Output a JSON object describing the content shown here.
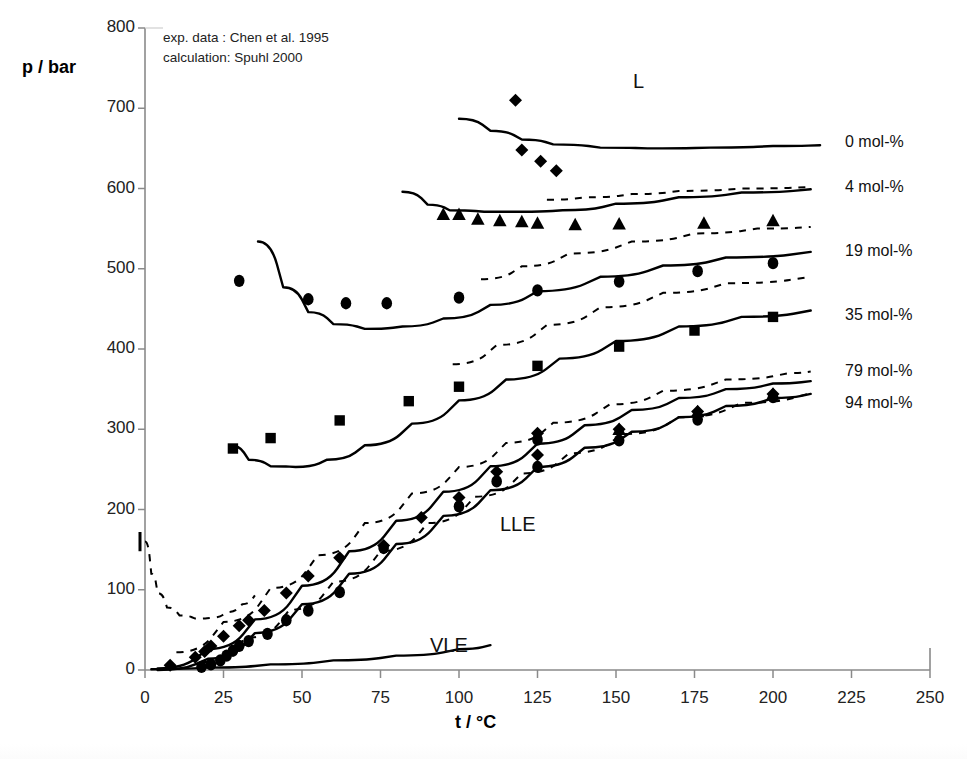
{
  "figure": {
    "annotations": [
      "exp. data  : Chen et al. 1995",
      "calculation: Spuhl 2000"
    ],
    "annotation_lines": {
      "line1": "exp. data  : Chen et al. 1995",
      "line2": "calculation: Spuhl 2000"
    }
  },
  "chart_data": {
    "type": "scatter",
    "title": "",
    "subtitle": "",
    "xlabel": "t / °C",
    "ylabel": "p / bar",
    "xlim": [
      0,
      250
    ],
    "ylim": [
      0,
      800
    ],
    "xticks": [
      0,
      25,
      50,
      75,
      100,
      125,
      150,
      175,
      200,
      225,
      250
    ],
    "yticks": [
      0,
      100,
      200,
      300,
      400,
      500,
      600,
      700,
      800
    ],
    "xtick_labels": [
      "0",
      "25",
      "50",
      "75",
      "100",
      "125",
      "150",
      "175",
      "200",
      "225",
      "250"
    ],
    "ytick_labels": [
      "0",
      "100",
      "200",
      "300",
      "400",
      "500",
      "600",
      "700",
      "800"
    ],
    "grid": false,
    "legend_position": "right-inline",
    "annotations": [
      {
        "text": "L",
        "x": 128,
        "y": 730
      },
      {
        "text": "LLE",
        "x": 130,
        "y": 195
      },
      {
        "text": "VLE",
        "x": 123,
        "y": 22
      },
      {
        "text": "exp. data  : Chen et al. 1995",
        "x": 12,
        "y": 768
      },
      {
        "text": "calculation: Spuhl 2000",
        "x": 12,
        "y": 742
      }
    ],
    "series": [
      {
        "name": "0 mol-%",
        "label": "0 mol-%",
        "label_y": 655,
        "marker": "diamond",
        "points": [
          {
            "x": 118,
            "y": 710
          },
          {
            "x": 120,
            "y": 648
          },
          {
            "x": 126,
            "y": 634
          },
          {
            "x": 131,
            "y": 622
          }
        ],
        "solid_curve": [
          {
            "x": 100,
            "y": 687
          },
          {
            "x": 110,
            "y": 672
          },
          {
            "x": 120,
            "y": 661
          },
          {
            "x": 130,
            "y": 655
          },
          {
            "x": 145,
            "y": 651
          },
          {
            "x": 160,
            "y": 650
          },
          {
            "x": 180,
            "y": 651
          },
          {
            "x": 200,
            "y": 653
          },
          {
            "x": 215,
            "y": 654
          }
        ],
        "dashed_curve": []
      },
      {
        "name": "4 mol-%",
        "label": "4 mol-%",
        "label_y": 600,
        "marker": "triangle",
        "points": [
          {
            "x": 95,
            "y": 568
          },
          {
            "x": 100,
            "y": 568
          },
          {
            "x": 106,
            "y": 562
          },
          {
            "x": 113,
            "y": 560
          },
          {
            "x": 120,
            "y": 559
          },
          {
            "x": 125,
            "y": 557
          },
          {
            "x": 137,
            "y": 555
          },
          {
            "x": 151,
            "y": 556
          },
          {
            "x": 178,
            "y": 557
          },
          {
            "x": 200,
            "y": 560
          }
        ],
        "solid_curve": [
          {
            "x": 82,
            "y": 596
          },
          {
            "x": 90,
            "y": 580
          },
          {
            "x": 97,
            "y": 573
          },
          {
            "x": 108,
            "y": 571
          },
          {
            "x": 120,
            "y": 571
          },
          {
            "x": 133,
            "y": 573
          },
          {
            "x": 150,
            "y": 581
          },
          {
            "x": 170,
            "y": 589
          },
          {
            "x": 190,
            "y": 595
          },
          {
            "x": 212,
            "y": 599
          }
        ],
        "dashed_curve": [
          {
            "x": 128,
            "y": 586
          },
          {
            "x": 140,
            "y": 589
          },
          {
            "x": 155,
            "y": 593
          },
          {
            "x": 170,
            "y": 597
          },
          {
            "x": 190,
            "y": 600
          },
          {
            "x": 212,
            "y": 602
          }
        ]
      },
      {
        "name": "19 mol-%",
        "label": "19 mol-%",
        "label_y": 520,
        "marker": "circle",
        "points": [
          {
            "x": 30,
            "y": 485
          },
          {
            "x": 52,
            "y": 462
          },
          {
            "x": 64,
            "y": 457
          },
          {
            "x": 77,
            "y": 457
          },
          {
            "x": 100,
            "y": 464
          },
          {
            "x": 125,
            "y": 473
          },
          {
            "x": 151,
            "y": 484
          },
          {
            "x": 176,
            "y": 497
          },
          {
            "x": 200,
            "y": 507
          }
        ],
        "solid_curve": [
          {
            "x": 36,
            "y": 534
          },
          {
            "x": 44,
            "y": 477
          },
          {
            "x": 52,
            "y": 446
          },
          {
            "x": 60,
            "y": 431
          },
          {
            "x": 70,
            "y": 425
          },
          {
            "x": 82,
            "y": 428
          },
          {
            "x": 95,
            "y": 438
          },
          {
            "x": 110,
            "y": 455
          },
          {
            "x": 125,
            "y": 472
          },
          {
            "x": 145,
            "y": 490
          },
          {
            "x": 165,
            "y": 504
          },
          {
            "x": 185,
            "y": 514
          },
          {
            "x": 212,
            "y": 521
          }
        ],
        "dashed_curve": [
          {
            "x": 107,
            "y": 487
          },
          {
            "x": 120,
            "y": 503
          },
          {
            "x": 135,
            "y": 519
          },
          {
            "x": 155,
            "y": 534
          },
          {
            "x": 175,
            "y": 544
          },
          {
            "x": 195,
            "y": 550
          },
          {
            "x": 212,
            "y": 552
          }
        ]
      },
      {
        "name": "35 mol-%",
        "label": "35 mol-%",
        "label_y": 440,
        "marker": "square",
        "points": [
          {
            "x": 28,
            "y": 276
          },
          {
            "x": 40,
            "y": 289
          },
          {
            "x": 62,
            "y": 311
          },
          {
            "x": 84,
            "y": 335
          },
          {
            "x": 100,
            "y": 353
          },
          {
            "x": 125,
            "y": 379
          },
          {
            "x": 151,
            "y": 403
          },
          {
            "x": 175,
            "y": 423
          },
          {
            "x": 200,
            "y": 440
          }
        ],
        "solid_curve": [
          {
            "x": 27,
            "y": 280
          },
          {
            "x": 33,
            "y": 262
          },
          {
            "x": 40,
            "y": 254
          },
          {
            "x": 48,
            "y": 253
          },
          {
            "x": 58,
            "y": 262
          },
          {
            "x": 70,
            "y": 280
          },
          {
            "x": 85,
            "y": 307
          },
          {
            "x": 100,
            "y": 336
          },
          {
            "x": 115,
            "y": 362
          },
          {
            "x": 132,
            "y": 388
          },
          {
            "x": 150,
            "y": 410
          },
          {
            "x": 170,
            "y": 428
          },
          {
            "x": 190,
            "y": 440
          },
          {
            "x": 212,
            "y": 448
          }
        ],
        "dashed_curve": [
          {
            "x": 98,
            "y": 381
          },
          {
            "x": 112,
            "y": 405
          },
          {
            "x": 128,
            "y": 430
          },
          {
            "x": 145,
            "y": 452
          },
          {
            "x": 165,
            "y": 470
          },
          {
            "x": 185,
            "y": 482
          },
          {
            "x": 212,
            "y": 490
          }
        ]
      },
      {
        "name": "79 mol-%",
        "label": "79 mol-%",
        "label_y": 370,
        "marker": "diamond",
        "points": [
          {
            "x": 8,
            "y": 6
          },
          {
            "x": 16,
            "y": 16
          },
          {
            "x": 19,
            "y": 23
          },
          {
            "x": 21,
            "y": 30
          },
          {
            "x": 25,
            "y": 42
          },
          {
            "x": 30,
            "y": 55
          },
          {
            "x": 33,
            "y": 62
          },
          {
            "x": 38,
            "y": 74
          },
          {
            "x": 45,
            "y": 96
          },
          {
            "x": 52,
            "y": 117
          },
          {
            "x": 62,
            "y": 140
          },
          {
            "x": 76,
            "y": 155
          },
          {
            "x": 88,
            "y": 190
          },
          {
            "x": 100,
            "y": 215
          },
          {
            "x": 112,
            "y": 247
          },
          {
            "x": 125,
            "y": 268
          },
          {
            "x": 125,
            "y": 295
          },
          {
            "x": 151,
            "y": 300
          },
          {
            "x": 176,
            "y": 322
          },
          {
            "x": 200,
            "y": 344
          }
        ],
        "solid_curve": [
          {
            "x": 4,
            "y": 2
          },
          {
            "x": 20,
            "y": 26
          },
          {
            "x": 35,
            "y": 63
          },
          {
            "x": 50,
            "y": 105
          },
          {
            "x": 65,
            "y": 148
          },
          {
            "x": 80,
            "y": 186
          },
          {
            "x": 95,
            "y": 222
          },
          {
            "x": 110,
            "y": 254
          },
          {
            "x": 125,
            "y": 282
          },
          {
            "x": 140,
            "y": 305
          },
          {
            "x": 155,
            "y": 324
          },
          {
            "x": 170,
            "y": 339
          },
          {
            "x": 185,
            "y": 350
          },
          {
            "x": 200,
            "y": 357
          },
          {
            "x": 212,
            "y": 360
          }
        ],
        "dashed_curve": [
          {
            "x": 10,
            "y": 22
          },
          {
            "x": 25,
            "y": 60
          },
          {
            "x": 40,
            "y": 102
          },
          {
            "x": 55,
            "y": 143
          },
          {
            "x": 70,
            "y": 183
          },
          {
            "x": 85,
            "y": 220
          },
          {
            "x": 100,
            "y": 253
          },
          {
            "x": 115,
            "y": 283
          },
          {
            "x": 130,
            "y": 308
          },
          {
            "x": 148,
            "y": 331
          },
          {
            "x": 165,
            "y": 348
          },
          {
            "x": 185,
            "y": 362
          },
          {
            "x": 205,
            "y": 370
          },
          {
            "x": 212,
            "y": 372
          }
        ]
      },
      {
        "name": "94 mol-%",
        "label": "94 mol-%",
        "label_y": 330,
        "marker": "circle",
        "points": [
          {
            "x": 18,
            "y": 4
          },
          {
            "x": 21,
            "y": 7
          },
          {
            "x": 24,
            "y": 12
          },
          {
            "x": 26,
            "y": 18
          },
          {
            "x": 28,
            "y": 24
          },
          {
            "x": 30,
            "y": 30
          },
          {
            "x": 33,
            "y": 36
          },
          {
            "x": 39,
            "y": 45
          },
          {
            "x": 45,
            "y": 62
          },
          {
            "x": 52,
            "y": 74
          },
          {
            "x": 62,
            "y": 97
          },
          {
            "x": 76,
            "y": 152
          },
          {
            "x": 100,
            "y": 204
          },
          {
            "x": 112,
            "y": 235
          },
          {
            "x": 125,
            "y": 253
          },
          {
            "x": 125,
            "y": 287
          },
          {
            "x": 151,
            "y": 286
          },
          {
            "x": 176,
            "y": 312
          },
          {
            "x": 200,
            "y": 340
          }
        ],
        "triangle_points": [
          {
            "x": 151,
            "y": 300
          },
          {
            "x": 176,
            "y": 322
          },
          {
            "x": 200,
            "y": 344
          }
        ],
        "solid_curve": [
          {
            "x": 4,
            "y": 0
          },
          {
            "x": 20,
            "y": 14
          },
          {
            "x": 35,
            "y": 46
          },
          {
            "x": 50,
            "y": 82
          },
          {
            "x": 65,
            "y": 120
          },
          {
            "x": 80,
            "y": 157
          },
          {
            "x": 95,
            "y": 192
          },
          {
            "x": 110,
            "y": 224
          },
          {
            "x": 125,
            "y": 253
          },
          {
            "x": 140,
            "y": 277
          },
          {
            "x": 155,
            "y": 297
          },
          {
            "x": 170,
            "y": 315
          },
          {
            "x": 185,
            "y": 329
          },
          {
            "x": 200,
            "y": 339
          },
          {
            "x": 212,
            "y": 344
          }
        ],
        "dashed_curve": [
          {
            "x": 18,
            "y": 10
          },
          {
            "x": 32,
            "y": 40
          },
          {
            "x": 46,
            "y": 75
          },
          {
            "x": 60,
            "y": 110
          },
          {
            "x": 75,
            "y": 148
          },
          {
            "x": 90,
            "y": 183
          },
          {
            "x": 105,
            "y": 216
          },
          {
            "x": 120,
            "y": 245
          },
          {
            "x": 135,
            "y": 270
          },
          {
            "x": 152,
            "y": 294
          },
          {
            "x": 170,
            "y": 315
          },
          {
            "x": 190,
            "y": 333
          },
          {
            "x": 212,
            "y": 345
          }
        ]
      },
      {
        "name": "VLE",
        "label": "VLE",
        "label_y": 22,
        "marker": "none",
        "points": [],
        "solid_curve": [
          {
            "x": 2,
            "y": 1
          },
          {
            "x": 20,
            "y": 3
          },
          {
            "x": 40,
            "y": 7
          },
          {
            "x": 60,
            "y": 12
          },
          {
            "x": 80,
            "y": 18
          },
          {
            "x": 100,
            "y": 26
          },
          {
            "x": 110,
            "y": 31
          }
        ],
        "dashed_curve": []
      },
      {
        "name": "low-T branch",
        "label": "",
        "label_y": 0,
        "marker": "none",
        "points": [],
        "solid_curve": [],
        "dashed_curve": [
          {
            "x": 0,
            "y": 160
          },
          {
            "x": 2,
            "y": 120
          },
          {
            "x": 4,
            "y": 96
          },
          {
            "x": 7,
            "y": 78
          },
          {
            "x": 11,
            "y": 68
          },
          {
            "x": 16,
            "y": 64
          },
          {
            "x": 21,
            "y": 65
          },
          {
            "x": 26,
            "y": 72
          },
          {
            "x": 31,
            "y": 82
          },
          {
            "x": 35,
            "y": 93
          }
        ]
      }
    ]
  }
}
